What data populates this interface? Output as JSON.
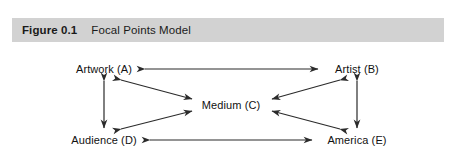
{
  "caption": {
    "number": "Figure 0.1",
    "title": "Focal Points Model",
    "bar_color": "#d2d2d2",
    "text_color": "#1a1a1a"
  },
  "diagram": {
    "type": "node-link",
    "arrow_color": "#2b2b2b",
    "arrow_style": "double-headed",
    "nodes": [
      {
        "id": "A",
        "label": "Artwork (A)",
        "position": "top-left"
      },
      {
        "id": "B",
        "label": "Artist (B)",
        "position": "top-right"
      },
      {
        "id": "C",
        "label": "Medium (C)",
        "position": "center"
      },
      {
        "id": "D",
        "label": "Audience (D)",
        "position": "bottom-left"
      },
      {
        "id": "E",
        "label": "America (E)",
        "position": "bottom-right"
      }
    ],
    "edges": [
      {
        "from": "A",
        "to": "B",
        "bidirectional": true
      },
      {
        "from": "A",
        "to": "D",
        "bidirectional": true
      },
      {
        "from": "B",
        "to": "E",
        "bidirectional": true
      },
      {
        "from": "D",
        "to": "E",
        "bidirectional": true
      },
      {
        "from": "A",
        "to": "C",
        "bidirectional": true
      },
      {
        "from": "B",
        "to": "C",
        "bidirectional": true
      },
      {
        "from": "D",
        "to": "C",
        "bidirectional": true
      },
      {
        "from": "E",
        "to": "C",
        "bidirectional": true
      }
    ]
  }
}
